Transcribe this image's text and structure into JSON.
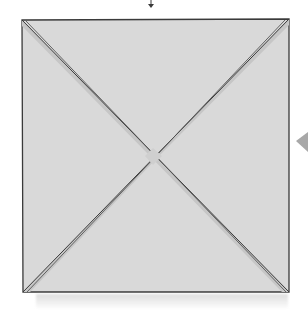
{
  "diagram": {
    "kind": "origami-fold-step",
    "shape": "square",
    "colors": {
      "paper_fill": "#d9d9d9",
      "band_fill": "#c7c7c7",
      "outline": "#3a3a3a",
      "pointer": "#a8a8a8",
      "background": "#ffffff"
    },
    "elements": [
      {
        "type": "arrow",
        "direction": "down",
        "position": "top-center"
      },
      {
        "type": "square",
        "corners": [
          [
            22,
            20
          ],
          [
            289,
            20
          ],
          [
            289,
            292
          ],
          [
            22,
            292
          ]
        ]
      },
      {
        "type": "diagonal-crease",
        "from": "top-left",
        "to": "bottom-right"
      },
      {
        "type": "diagonal-crease",
        "from": "top-right",
        "to": "bottom-left"
      },
      {
        "type": "pointer-triangle",
        "position": "right-edge",
        "direction": "left"
      }
    ]
  }
}
